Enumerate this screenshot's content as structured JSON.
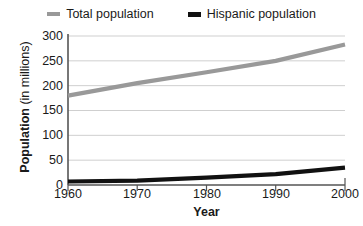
{
  "legend": {
    "position": "top-center",
    "items": [
      {
        "label": "Total population",
        "color": "#999999",
        "icon": "line-swatch-icon"
      },
      {
        "label": "Hispanic population",
        "color": "#111111",
        "icon": "line-swatch-icon"
      }
    ]
  },
  "axes": {
    "y_title_strong": "Population",
    "y_title_regular": " (in millions)",
    "x_title": "Year",
    "y_ticks": [
      "0",
      "50",
      "100",
      "150",
      "200",
      "250",
      "300"
    ],
    "x_ticks": [
      "1960",
      "1970",
      "1980",
      "1990",
      "2000"
    ]
  },
  "chart_data": {
    "type": "line",
    "title": "",
    "subtitle": "",
    "xlabel": "Year",
    "ylabel": "Population (in millions)",
    "x": [
      1960,
      1970,
      1980,
      1990,
      2000
    ],
    "xlim": [
      1960,
      2000
    ],
    "ylim": [
      0,
      300
    ],
    "yticks": [
      0,
      50,
      100,
      150,
      200,
      250,
      300
    ],
    "xticks": [
      1960,
      1970,
      1980,
      1990,
      2000
    ],
    "grid": "horizontal",
    "legend_position": "top-center",
    "series": [
      {
        "name": "Total population",
        "color": "#999999",
        "values": [
          180,
          205,
          227,
          250,
          283
        ]
      },
      {
        "name": "Hispanic population",
        "color": "#111111",
        "values": [
          7,
          9,
          15,
          22,
          35
        ]
      }
    ]
  }
}
